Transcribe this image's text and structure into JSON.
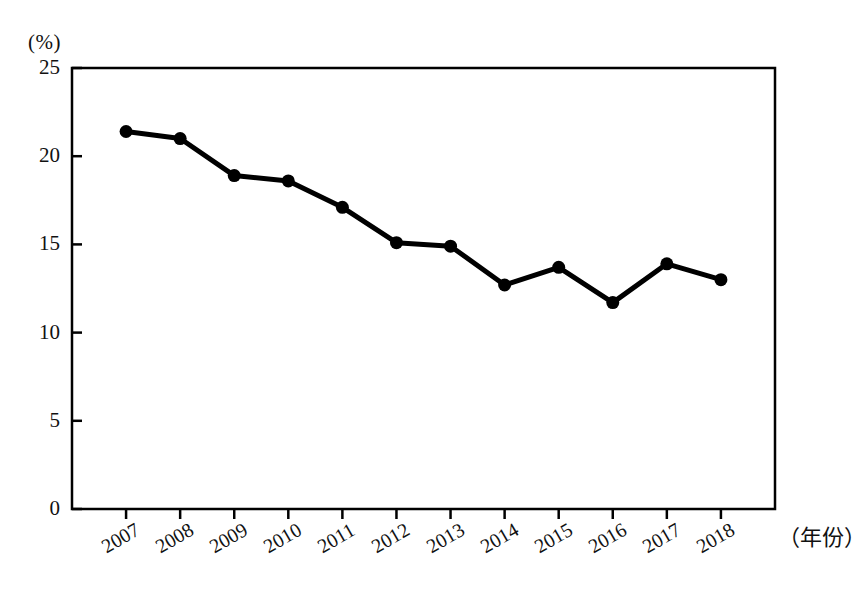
{
  "chart_data": {
    "type": "line",
    "title": "",
    "subtitle": "",
    "xlabel": "（年份）",
    "ylabel": "(%)",
    "categories": [
      "2007",
      "2008",
      "2009",
      "2010",
      "2011",
      "2012",
      "2013",
      "2014",
      "2015",
      "2016",
      "2017",
      "2018"
    ],
    "values": [
      21.4,
      21.0,
      18.9,
      18.6,
      17.1,
      15.1,
      14.9,
      12.7,
      13.7,
      11.7,
      13.9,
      13.0
    ],
    "series": [
      {
        "name": "",
        "values": [
          21.4,
          21.0,
          18.9,
          18.6,
          17.1,
          15.1,
          14.9,
          12.7,
          13.7,
          11.7,
          13.9,
          13.0
        ]
      }
    ],
    "ylim": [
      0,
      25
    ],
    "ytick_labels": [
      "0",
      "5",
      "10",
      "15",
      "20",
      "25"
    ],
    "ytick_values": [
      0,
      5,
      10,
      15,
      20,
      25
    ],
    "xtick_labels": [
      "2007",
      "2008",
      "2009",
      "2010",
      "2011",
      "2012",
      "2013",
      "2014",
      "2015",
      "2016",
      "2017",
      "2018"
    ],
    "grid": false,
    "legend": "none",
    "marker": "filled-circle",
    "line_color": "#000000",
    "marker_color": "#000000",
    "axis_color": "#000000",
    "background_color": "#ffffff",
    "annotations": []
  },
  "axes": {
    "y_unit_label": "(%)",
    "x_axis_name": "（年份）"
  }
}
